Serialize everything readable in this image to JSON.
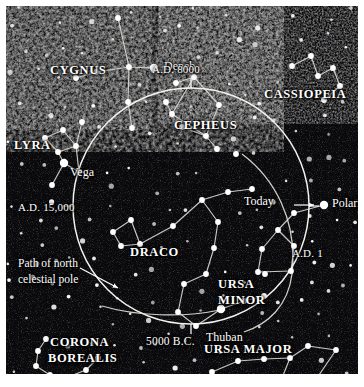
{
  "figure": {
    "background_color": "#0a0a0c",
    "star_color": "#ffffff",
    "line_color": "#d8d8d2",
    "border_color": "#ffffff"
  },
  "labels": {
    "cygnus": "CYGNUS",
    "lyra": "LYRA",
    "cepheus": "CEPHEUS",
    "cassiopeia": "CASSIOPEIA",
    "draco": "DRACO",
    "ursa_minor_line1": "URSA",
    "ursa_minor_line2": "MINOR",
    "ursa_major": "URSA MAJOR",
    "corona_line1": "CORONA",
    "corona_line2": "BOREALIS",
    "deneb": "Deneb",
    "vega": "Vega",
    "polaris": "Polaris",
    "thuban": "Thuban",
    "today": "Today",
    "path_line1": "Path of north",
    "path_line2": "celestial pole"
  },
  "epoch_markers": [
    {
      "name": "ad-8000",
      "text": "A.D. 8000",
      "position": "top"
    },
    {
      "name": "ad-1",
      "text": "A.D. 1",
      "position": "right"
    },
    {
      "name": "5000-bc",
      "text": "5000 B.C.",
      "position": "bottom"
    },
    {
      "name": "ad-15000",
      "text": "A.D. 15,000",
      "position": "left"
    }
  ],
  "precession_circle": {
    "center_x": 185,
    "center_y": 200,
    "radius": 118,
    "description": "26,000-year circle traced by the north celestial pole"
  },
  "chart_data": {
    "type": "scatter",
    "named_stars": [
      {
        "name": "Deneb",
        "x": 148,
        "y": 62,
        "mag": 1.3
      },
      {
        "name": "Vega",
        "x": 58,
        "y": 157,
        "mag": 1.0
      },
      {
        "name": "Polaris",
        "x": 318,
        "y": 199,
        "mag": 1.2
      },
      {
        "name": "Thuban",
        "x": 215,
        "y": 303,
        "mag": 1.1
      }
    ],
    "constellations": [
      {
        "name": "CYGNUS",
        "stars": [
          [
            112,
            12
          ],
          [
            123,
            61
          ],
          [
            148,
            62
          ],
          [
            70,
            72
          ],
          [
            90,
            66
          ],
          [
            122,
            96
          ],
          [
            126,
            122
          ]
        ],
        "lines": [
          [
            [
              112,
              12
            ],
            [
              123,
              61
            ]
          ],
          [
            [
              123,
              61
            ],
            [
              148,
              62
            ]
          ],
          [
            [
              123,
              61
            ],
            [
              90,
              66
            ]
          ],
          [
            [
              90,
              66
            ],
            [
              70,
              72
            ]
          ],
          [
            [
              123,
              61
            ],
            [
              122,
              96
            ]
          ],
          [
            [
              122,
              96
            ],
            [
              126,
              122
            ]
          ]
        ]
      },
      {
        "name": "LYRA",
        "stars": [
          [
            58,
            157
          ],
          [
            39,
            132
          ],
          [
            57,
            124
          ],
          [
            52,
            146
          ],
          [
            70,
            140
          ],
          [
            76,
            116
          ],
          [
            73,
            166
          ],
          [
            46,
            179
          ]
        ],
        "lines": [
          [
            [
              39,
              132
            ],
            [
              52,
              146
            ]
          ],
          [
            [
              52,
              146
            ],
            [
              58,
              157
            ]
          ],
          [
            [
              39,
              132
            ],
            [
              57,
              124
            ]
          ],
          [
            [
              57,
              124
            ],
            [
              70,
              140
            ]
          ],
          [
            [
              70,
              140
            ],
            [
              76,
              116
            ]
          ],
          [
            [
              70,
              140
            ],
            [
              73,
              166
            ]
          ],
          [
            [
              58,
              157
            ],
            [
              73,
              166
            ]
          ],
          [
            [
              58,
              157
            ],
            [
              46,
              179
            ]
          ],
          [
            [
              52,
              146
            ],
            [
              70,
              140
            ]
          ]
        ]
      },
      {
        "name": "CEPHEUS",
        "stars": [
          [
            188,
            71
          ],
          [
            170,
            77
          ],
          [
            213,
            99
          ],
          [
            200,
            130
          ],
          [
            166,
            108
          ],
          [
            160,
            96
          ],
          [
            176,
            121
          ],
          [
            211,
            143
          ],
          [
            230,
            148
          ]
        ],
        "lines": [
          [
            [
              188,
              71
            ],
            [
              213,
              99
            ]
          ],
          [
            [
              213,
              99
            ],
            [
              200,
              130
            ]
          ],
          [
            [
              200,
              130
            ],
            [
              166,
              108
            ]
          ],
          [
            [
              166,
              108
            ],
            [
              188,
              71
            ]
          ],
          [
            [
              166,
              108
            ],
            [
              160,
              96
            ]
          ],
          [
            [
              200,
              130
            ],
            [
              211,
              143
            ]
          ],
          [
            [
              170,
              77
            ],
            [
              188,
              71
            ]
          ],
          [
            [
              176,
              121
            ],
            [
              200,
              130
            ]
          ]
        ]
      },
      {
        "name": "CASSIOPEIA",
        "stars": [
          [
            286,
            60
          ],
          [
            305,
            50
          ],
          [
            312,
            70
          ],
          [
            327,
            62
          ],
          [
            334,
            80
          ],
          [
            318,
            94
          ]
        ],
        "lines": [
          [
            [
              286,
              60
            ],
            [
              305,
              50
            ]
          ],
          [
            [
              305,
              50
            ],
            [
              312,
              70
            ]
          ],
          [
            [
              312,
              70
            ],
            [
              327,
              62
            ]
          ],
          [
            [
              327,
              62
            ],
            [
              334,
              80
            ]
          ],
          [
            [
              334,
              80
            ],
            [
              318,
              94
            ]
          ]
        ]
      },
      {
        "name": "DRACO",
        "stars": [
          [
            125,
            214
          ],
          [
            107,
            226
          ],
          [
            115,
            240
          ],
          [
            134,
            238
          ],
          [
            167,
            220
          ],
          [
            196,
            194
          ],
          [
            212,
            216
          ],
          [
            208,
            242
          ],
          [
            200,
            268
          ],
          [
            178,
            278
          ],
          [
            172,
            306
          ],
          [
            190,
            320
          ],
          [
            215,
            303
          ],
          [
            238,
            295
          ],
          [
            258,
            290
          ],
          [
            222,
            186
          ],
          [
            246,
            183
          ]
        ],
        "lines": [
          [
            [
              125,
              214
            ],
            [
              107,
              226
            ]
          ],
          [
            [
              107,
              226
            ],
            [
              115,
              240
            ]
          ],
          [
            [
              115,
              240
            ],
            [
              134,
              238
            ]
          ],
          [
            [
              134,
              238
            ],
            [
              125,
              214
            ]
          ],
          [
            [
              134,
              238
            ],
            [
              167,
              220
            ]
          ],
          [
            [
              167,
              220
            ],
            [
              196,
              194
            ]
          ],
          [
            [
              196,
              194
            ],
            [
              212,
              216
            ]
          ],
          [
            [
              212,
              216
            ],
            [
              208,
              242
            ]
          ],
          [
            [
              208,
              242
            ],
            [
              200,
              268
            ]
          ],
          [
            [
              200,
              268
            ],
            [
              178,
              278
            ]
          ],
          [
            [
              178,
              278
            ],
            [
              172,
              306
            ]
          ],
          [
            [
              172,
              306
            ],
            [
              190,
              320
            ]
          ],
          [
            [
              190,
              320
            ],
            [
              215,
              303
            ]
          ],
          [
            [
              215,
              303
            ],
            [
              238,
              295
            ]
          ],
          [
            [
              238,
              295
            ],
            [
              258,
              290
            ]
          ],
          [
            [
              196,
              194
            ],
            [
              222,
              186
            ]
          ],
          [
            [
              222,
              186
            ],
            [
              246,
              183
            ]
          ]
        ]
      },
      {
        "name": "URSA MINOR",
        "stars": [
          [
            318,
            199
          ],
          [
            288,
            207
          ],
          [
            272,
            224
          ],
          [
            256,
            243
          ],
          [
            252,
            266
          ],
          [
            285,
            265
          ],
          [
            288,
            240
          ],
          [
            259,
            268
          ]
        ],
        "lines": [
          [
            [
              318,
              199
            ],
            [
              288,
              207
            ]
          ],
          [
            [
              288,
              207
            ],
            [
              272,
              224
            ]
          ],
          [
            [
              272,
              224
            ],
            [
              288,
              240
            ]
          ],
          [
            [
              288,
              240
            ],
            [
              285,
              265
            ]
          ],
          [
            [
              285,
              265
            ],
            [
              252,
              266
            ]
          ],
          [
            [
              252,
              266
            ],
            [
              256,
              243
            ]
          ],
          [
            [
              256,
              243
            ],
            [
              272,
              224
            ]
          ]
        ]
      },
      {
        "name": "URSA MAJOR",
        "stars": [
          [
            206,
            366
          ],
          [
            232,
            355
          ],
          [
            258,
            353
          ],
          [
            284,
            352
          ],
          [
            311,
            372
          ],
          [
            330,
            344
          ],
          [
            302,
            340
          ],
          [
            276,
            372
          ]
        ],
        "lines": [
          [
            [
              206,
              366
            ],
            [
              232,
              355
            ]
          ],
          [
            [
              232,
              355
            ],
            [
              258,
              353
            ]
          ],
          [
            [
              258,
              353
            ],
            [
              284,
              352
            ]
          ],
          [
            [
              284,
              352
            ],
            [
              302,
              340
            ]
          ],
          [
            [
              302,
              340
            ],
            [
              330,
              344
            ]
          ],
          [
            [
              330,
              344
            ],
            [
              311,
              372
            ]
          ],
          [
            [
              311,
              372
            ],
            [
              276,
              372
            ]
          ],
          [
            [
              276,
              372
            ],
            [
              284,
              352
            ]
          ]
        ]
      },
      {
        "name": "CORONA BOREALIS",
        "stars": [
          [
            40,
            333
          ],
          [
            32,
            345
          ],
          [
            30,
            360
          ],
          [
            44,
            369
          ],
          [
            62,
            371
          ],
          [
            80,
            364
          ],
          [
            92,
            352
          ]
        ],
        "lines": [
          [
            [
              40,
              333
            ],
            [
              32,
              345
            ]
          ],
          [
            [
              32,
              345
            ],
            [
              30,
              360
            ]
          ],
          [
            [
              30,
              360
            ],
            [
              44,
              369
            ]
          ],
          [
            [
              44,
              369
            ],
            [
              62,
              371
            ]
          ],
          [
            [
              62,
              371
            ],
            [
              80,
              364
            ]
          ],
          [
            [
              80,
              364
            ],
            [
              92,
              352
            ]
          ]
        ]
      }
    ]
  }
}
